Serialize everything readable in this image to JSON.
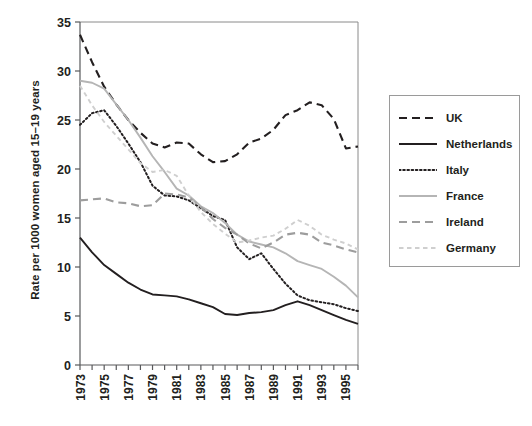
{
  "chart_data": {
    "type": "line",
    "title": "",
    "xlabel": "",
    "ylabel": "Rate per 1000 women aged 15–19 years",
    "xlim": [
      1973,
      1996
    ],
    "ylim": [
      0,
      35
    ],
    "yticks": [
      0,
      5,
      10,
      15,
      20,
      25,
      30,
      35
    ],
    "xticks": [
      1973,
      1974,
      1975,
      1976,
      1977,
      1978,
      1979,
      1980,
      1981,
      1982,
      1983,
      1984,
      1985,
      1986,
      1987,
      1988,
      1989,
      1990,
      1991,
      1992,
      1993,
      1994,
      1995,
      1996
    ],
    "xtick_labels": [
      "1973",
      "",
      "1975",
      "",
      "1977",
      "",
      "1979",
      "",
      "1981",
      "",
      "1983",
      "",
      "1985",
      "",
      "1987",
      "",
      "1989",
      "",
      "1991",
      "",
      "1993",
      "",
      "1995",
      ""
    ],
    "grid": false,
    "legend_position": "right",
    "x": [
      1973,
      1974,
      1975,
      1976,
      1977,
      1978,
      1979,
      1980,
      1981,
      1982,
      1983,
      1984,
      1985,
      1986,
      1987,
      1988,
      1989,
      1990,
      1991,
      1992,
      1993,
      1994,
      1995,
      1996
    ],
    "series": [
      {
        "name": "UK",
        "color": "#231f20",
        "style": "dashed",
        "values": [
          33.7,
          30.9,
          28.4,
          26.6,
          25.0,
          23.7,
          22.6,
          22.2,
          22.7,
          22.6,
          21.5,
          20.7,
          20.8,
          21.5,
          22.7,
          23.1,
          24.0,
          25.5,
          26.0,
          26.8,
          26.5,
          25.1,
          22.1,
          22.3
        ]
      },
      {
        "name": "Netherlands",
        "color": "#231f20",
        "style": "solid",
        "values": [
          13.0,
          11.5,
          10.2,
          9.3,
          8.4,
          7.7,
          7.2,
          7.1,
          7.0,
          6.7,
          6.3,
          5.9,
          5.2,
          5.1,
          5.3,
          5.4,
          5.6,
          6.1,
          6.5,
          6.1,
          5.6,
          5.1,
          4.6,
          4.2
        ]
      },
      {
        "name": "Italy",
        "color": "#231f20",
        "style": "dotted",
        "values": [
          24.5,
          25.7,
          26.0,
          24.4,
          22.6,
          20.7,
          18.3,
          17.3,
          17.2,
          16.8,
          16.0,
          15.2,
          14.8,
          12.0,
          10.8,
          11.4,
          9.8,
          8.3,
          7.1,
          6.6,
          6.4,
          6.2,
          5.8,
          5.5
        ]
      },
      {
        "name": "France",
        "color": "#b5b5b5",
        "style": "solid",
        "values": [
          29.0,
          28.8,
          28.2,
          26.6,
          25.0,
          23.2,
          21.3,
          19.7,
          18.0,
          17.3,
          16.2,
          15.5,
          14.5,
          13.3,
          12.6,
          12.3,
          12.0,
          11.4,
          10.6,
          10.2,
          9.8,
          9.0,
          8.1,
          6.9
        ]
      },
      {
        "name": "Ireland",
        "color": "#9d9d9d",
        "style": "dashed",
        "values": [
          16.8,
          16.9,
          17.0,
          16.6,
          16.5,
          16.2,
          16.3,
          17.5,
          17.4,
          17.1,
          16.1,
          14.9,
          14.0,
          13.3,
          12.4,
          11.9,
          12.5,
          13.3,
          13.5,
          13.3,
          12.5,
          12.2,
          11.8,
          11.5
        ]
      },
      {
        "name": "Germany",
        "color": "#cfcfcf",
        "style": "dashed-light",
        "values": [
          28.5,
          26.5,
          24.8,
          23.4,
          22.0,
          20.6,
          19.7,
          19.9,
          19.3,
          17.3,
          15.6,
          14.4,
          13.4,
          12.5,
          12.7,
          13.0,
          13.2,
          13.9,
          14.8,
          14.2,
          13.3,
          12.8,
          12.4,
          11.8
        ]
      }
    ]
  },
  "legend": {
    "items": [
      {
        "label": "UK"
      },
      {
        "label": "Netherlands"
      },
      {
        "label": "Italy"
      },
      {
        "label": "France"
      },
      {
        "label": "Ireland"
      },
      {
        "label": "Germany"
      }
    ]
  }
}
